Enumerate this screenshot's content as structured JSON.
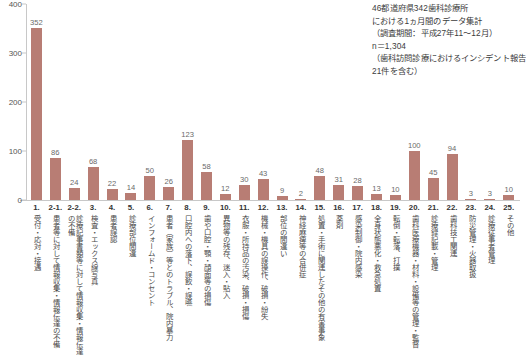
{
  "header": {
    "lines": [
      "46都道府県342歯科診療所",
      "における1ヵ月間のデータ集計",
      "（調査期間：平成27年11～12月）",
      "n＝1,304",
      "（歯科訪問診療におけるインシデント報告21件を含む）"
    ],
    "line1": "46都道府県342歯科診療所",
    "line2": "における1ヵ月間のデータ集計",
    "line3": "（調査期間：平成27年11～12月）",
    "line4": "n＝1,304",
    "line5": "（歯科訪問診療におけるインシデント報告21件を含む）"
  },
  "colors": {
    "bar": "#b87d74",
    "axis": "#c8c8c8",
    "text": "#3a3a3a"
  },
  "chart_data": {
    "type": "bar",
    "title": "",
    "xlabel": "",
    "ylabel": "",
    "ylim": [
      0,
      400
    ],
    "yticks": [
      0,
      100,
      200,
      300,
      400
    ],
    "ytick_labels": [
      "0",
      "100",
      "200",
      "300",
      "400"
    ],
    "grid": false,
    "legend": "none",
    "categories": [
      "1.",
      "2-1.",
      "2-2.",
      "3.",
      "4.",
      "5.",
      "6.",
      "7.",
      "8.",
      "9.",
      "10.",
      "11.",
      "12.",
      "13.",
      "14.",
      "15.",
      "16.",
      "17.",
      "18.",
      "19.",
      "20.",
      "21.",
      "22.",
      "23.",
      "24.",
      "25."
    ],
    "category_labels": [
      "受付・応対・接遇",
      "患者等に対して情報収集・情報伝達の不備",
      "診療記事書類等に対して情報収集・情報伝達の不備",
      "検査・エックス線写真",
      "患者誤認",
      "診療部位間違",
      "インフォームド・コンセント",
      "患者（家族）等とのトラブル、院内暴力",
      "口腔内への落下、誤飲・誤嚥",
      "歯や口腔・顎・顔面等の損傷",
      "異物等の残存、迷入・貼入",
      "衣服・所持品の汚染、破損・損傷",
      "機械・機具の誤操作、破損・紛失",
      "部位の間違い",
      "神経麻痺等の合併症",
      "処置・手術に関連したその他の有害事象",
      "薬剤",
      "感染制御・院内感染",
      "全身状態悪化・救急処置",
      "転倒・転落、打撲",
      "歯科医療機器・材料・設備等の管理・監督",
      "診療録記載・管理",
      "歯科技工関連",
      "防災管理・火器取扱",
      "診療従事者管理",
      "その他"
    ],
    "values": [
      352,
      86,
      24,
      68,
      22,
      14,
      50,
      26,
      123,
      58,
      12,
      30,
      43,
      9,
      2,
      48,
      31,
      28,
      13,
      10,
      100,
      45,
      94,
      3,
      3,
      10
    ]
  }
}
